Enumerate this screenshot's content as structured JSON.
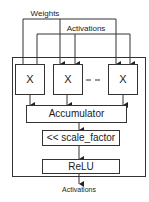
{
  "diagram": {
    "inputs": {
      "weights_label": "Weights",
      "activations_label": "Activations"
    },
    "multipliers": [
      {
        "label": "X"
      },
      {
        "label": "X"
      },
      {
        "label": "X"
      }
    ],
    "ellipsis": "- -",
    "stages": [
      {
        "label": "Accumulator"
      },
      {
        "label": "<< scale_factor"
      },
      {
        "label": "ReLU"
      }
    ],
    "output_label": "Activations",
    "colors": {
      "line": "#333333",
      "background": "#ffffff"
    }
  }
}
